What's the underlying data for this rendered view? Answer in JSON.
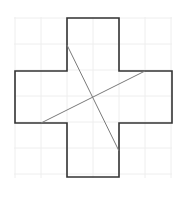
{
  "diagram": {
    "title": "",
    "type": "cross-shape-on-grid",
    "colors": {
      "background": "#ffffff",
      "grid": "#eeeeee",
      "outline": "#333333",
      "cut_line": "#7a7a7a"
    },
    "grid": {
      "origin_x": 15,
      "origin_y": 18,
      "cell": 26,
      "cols": 6,
      "rows": 6
    },
    "cross_outline_points": "67,18 119,18 119,71 172,71 172,123 119,123 119,177 67,177 67,123 15,123 15,71 67,71",
    "cut_lines": [
      {
        "x1": 67,
        "y1": 45,
        "x2": 119,
        "y2": 151
      },
      {
        "x1": 41,
        "y1": 123,
        "x2": 145,
        "y2": 71
      }
    ]
  }
}
